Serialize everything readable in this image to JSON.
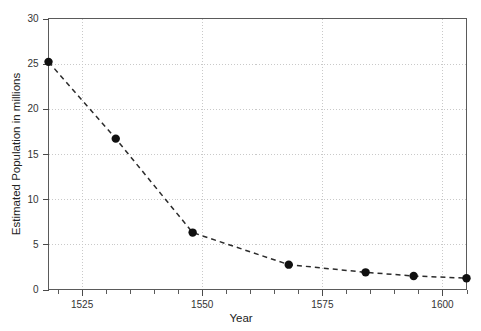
{
  "chart_data": {
    "type": "line",
    "title": "",
    "xlabel": "Year",
    "ylabel": "Estimated Population in millions",
    "xlim": [
      1518,
      1605
    ],
    "ylim": [
      0,
      30
    ],
    "grid": true,
    "legend": null,
    "marker": "filled-circle",
    "linestyle": "dashed",
    "x_ticks": [
      1525,
      1550,
      1575,
      1600
    ],
    "x_tick_labels": [
      "1525",
      "1550",
      "1575",
      "1600"
    ],
    "x_minor_tick_step": 5,
    "y_ticks": [
      0,
      5,
      10,
      15,
      20,
      25,
      30
    ],
    "y_tick_labels": [
      "0",
      "5",
      "10",
      "15",
      "20",
      "25",
      "30"
    ],
    "x": [
      1518,
      1532,
      1548,
      1568,
      1584,
      1594,
      1605
    ],
    "values": [
      25.2,
      16.7,
      6.3,
      2.75,
      1.9,
      1.5,
      1.25
    ],
    "points": [
      {
        "year": 1518,
        "population": 25.2
      },
      {
        "year": 1532,
        "population": 16.7
      },
      {
        "year": 1548,
        "population": 6.3
      },
      {
        "year": 1568,
        "population": 2.75
      },
      {
        "year": 1584,
        "population": 1.9
      },
      {
        "year": 1594,
        "population": 1.5
      },
      {
        "year": 1605,
        "population": 1.25
      }
    ],
    "colors": {
      "line": "#2b2b2b",
      "marker": "#101010",
      "grid": "#c9c9c9",
      "frame": "#5a5a5a",
      "background": "#ffffff",
      "text": "#333333"
    }
  }
}
